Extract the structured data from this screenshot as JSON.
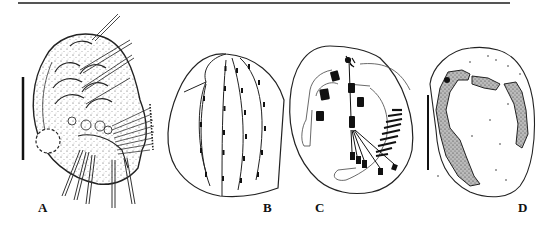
{
  "figure": {
    "panels": [
      {
        "id": "A",
        "label": "A",
        "description": "ciliate cell, ventral view, stippled, with cirri and membranelles",
        "scale_bar": true
      },
      {
        "id": "B",
        "label": "B",
        "description": "dorsal kinety pattern",
        "scale_bar": false
      },
      {
        "id": "C",
        "label": "C",
        "description": "ciliature and infraciliature, ventral view",
        "scale_bar": false
      },
      {
        "id": "D",
        "label": "D",
        "description": "macronucleus shape (C-shaped, stippled)",
        "scale_bar": true
      }
    ]
  },
  "colors": {
    "ink": "#111111",
    "rule": "#555555",
    "background": "#ffffff"
  }
}
